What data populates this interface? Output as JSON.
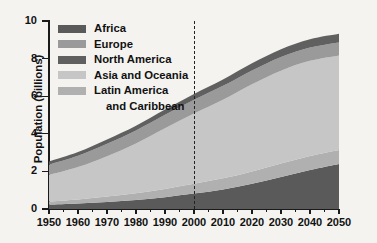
{
  "chart_data": {
    "type": "area",
    "title": "",
    "xlabel": "",
    "ylabel": "Population (billions)",
    "xlim": [
      1950,
      2050
    ],
    "ylim": [
      0,
      10
    ],
    "grid": false,
    "legend_position": "top-left",
    "stacked": true,
    "stack_order_bottom_to_top": [
      "Africa",
      "Latin America and Caribbean",
      "Asia and Oceania",
      "Europe",
      "North America"
    ],
    "x": [
      1950,
      1960,
      1970,
      1980,
      1990,
      2000,
      2010,
      2020,
      2030,
      2040,
      2050
    ],
    "xticks": [
      "1950",
      "1960",
      "1970",
      "1980",
      "1990",
      "2000",
      "2010",
      "2020",
      "2030",
      "2040",
      "2050"
    ],
    "yticks": [
      "0",
      "2",
      "4",
      "6",
      "8",
      "10"
    ],
    "annotations": [
      {
        "type": "vertical-dashed-line",
        "x": 2000,
        "label": ""
      }
    ],
    "series": [
      {
        "name": "Africa",
        "color": "#5a5a5a",
        "values": [
          0.23,
          0.29,
          0.37,
          0.48,
          0.63,
          0.82,
          1.04,
          1.34,
          1.7,
          2.07,
          2.39
        ]
      },
      {
        "name": "Latin America and Caribbean",
        "color": "#b0b0b0",
        "values": [
          0.17,
          0.22,
          0.29,
          0.36,
          0.44,
          0.52,
          0.59,
          0.66,
          0.72,
          0.75,
          0.75
        ]
      },
      {
        "name": "Asia and Oceania",
        "color": "#c6c6c6",
        "values": [
          1.41,
          1.72,
          2.15,
          2.65,
          3.22,
          3.74,
          4.18,
          4.63,
          4.94,
          5.06,
          5.03
        ]
      },
      {
        "name": "Europe",
        "color": "#9a9a9a",
        "values": [
          0.55,
          0.6,
          0.66,
          0.69,
          0.72,
          0.73,
          0.74,
          0.74,
          0.73,
          0.71,
          0.69
        ]
      },
      {
        "name": "North America",
        "color": "#606060",
        "values": [
          0.17,
          0.2,
          0.23,
          0.25,
          0.28,
          0.31,
          0.34,
          0.38,
          0.41,
          0.44,
          0.46
        ]
      }
    ],
    "totals": [
      2.53,
      3.03,
      3.7,
      4.43,
      5.29,
      6.12,
      6.89,
      7.75,
      8.5,
      9.03,
      9.32
    ]
  },
  "legend": {
    "items": [
      {
        "label": "Africa",
        "color": "#5a5a5a"
      },
      {
        "label": "Europe",
        "color": "#9a9a9a"
      },
      {
        "label": "North America",
        "color": "#606060"
      },
      {
        "label": "Asia and Oceania",
        "color": "#c6c6c6"
      },
      {
        "label": "Latin America",
        "color": "#b0b0b0"
      },
      {
        "label": "and Caribbean",
        "color": ""
      }
    ]
  },
  "axes": {
    "y": {
      "title": "Population (billions)",
      "ticks": [
        "10",
        "8",
        "6",
        "4",
        "2",
        "0"
      ]
    },
    "x": {
      "ticks": [
        "1950",
        "1960",
        "1970",
        "1980",
        "1990",
        "2000",
        "2010",
        "2020",
        "2030",
        "2040",
        "2050"
      ]
    }
  }
}
